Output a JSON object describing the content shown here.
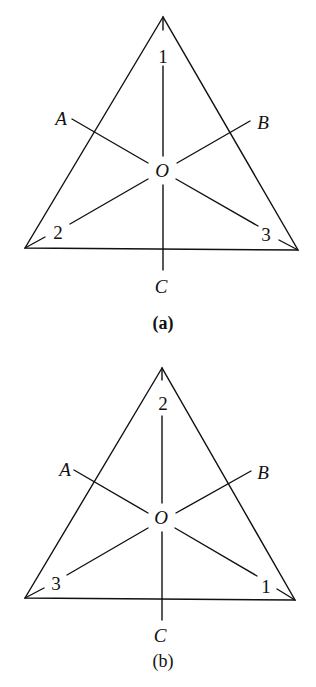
{
  "figure_a": {
    "caption": "(a)",
    "labels": {
      "A": "A",
      "B": "B",
      "C": "C",
      "O": "O"
    },
    "vertex_numbers": {
      "top": "1",
      "bottom_left": "2",
      "bottom_right": "3"
    }
  },
  "figure_b": {
    "caption": "(b)",
    "labels": {
      "A": "A",
      "B": "B",
      "C": "C",
      "O": "O"
    },
    "vertex_numbers": {
      "top": "2",
      "bottom_left": "3",
      "bottom_right": "1"
    }
  }
}
